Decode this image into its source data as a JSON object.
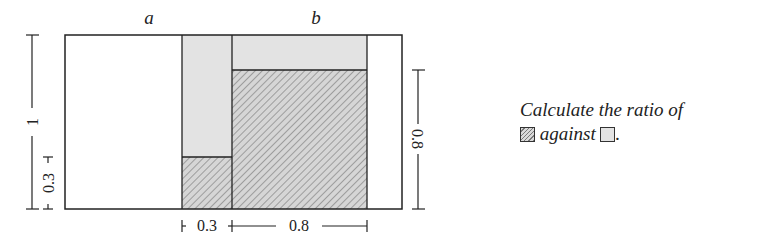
{
  "diagram": {
    "labels": {
      "a": "a",
      "b": "b"
    },
    "dimensions": {
      "left_total": "1",
      "left_small": "0.3",
      "right": "0.8",
      "bottom_small": "0.3",
      "bottom_large": "0.8"
    },
    "colors": {
      "gray_fill": "#e3e3e3",
      "hatch_bg": "#d6d6d6",
      "hatch_line": "#777777",
      "stroke": "#222222"
    }
  },
  "prompt": {
    "line1": "Calculate the ratio of",
    "against": "against",
    "period": "."
  }
}
